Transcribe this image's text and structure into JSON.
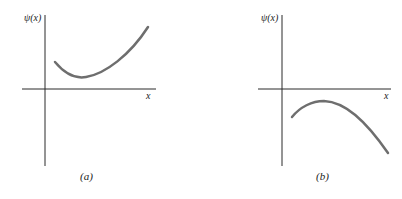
{
  "figure": {
    "panels": [
      {
        "id": "a",
        "caption": "(a)",
        "y_label": "ψ(x)",
        "x_label": "x",
        "curve_description": "positive, concave-up curve above x-axis with a minimum, rising to the right"
      },
      {
        "id": "b",
        "caption": "(b)",
        "y_label": "ψ(x)",
        "x_label": "x",
        "curve_description": "negative, concave-down curve below x-axis with a maximum, falling to the right"
      }
    ],
    "colors": {
      "axis": "#2a2a2a",
      "curve": "#6e6e6e",
      "background": "#ffffff"
    }
  }
}
